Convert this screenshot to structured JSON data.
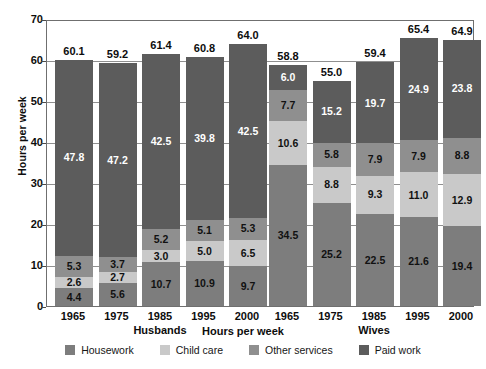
{
  "chart_data": {
    "type": "bar",
    "subtype": "stacked-bar-grouped",
    "title": "",
    "xlabel": "Hours per week",
    "ylabel": "Hours per week",
    "ylim": [
      0,
      70
    ],
    "yticks": [
      0,
      10,
      20,
      30,
      40,
      50,
      60,
      70
    ],
    "grid": true,
    "legend_position": "bottom",
    "categories": [
      "1965",
      "1975",
      "1985",
      "1995",
      "2000",
      "1965",
      "1975",
      "1985",
      "1995",
      "2000"
    ],
    "group_labels": [
      "Husbands",
      "Wives"
    ],
    "series": [
      {
        "name": "Housework",
        "color": "#7d7d7d",
        "values": [
          4.4,
          5.6,
          10.7,
          10.9,
          9.7,
          34.5,
          25.2,
          22.5,
          21.6,
          19.4
        ]
      },
      {
        "name": "Child care",
        "color": "#c9c9c9",
        "values": [
          2.6,
          2.7,
          3.0,
          5.0,
          6.5,
          10.6,
          8.8,
          9.3,
          11.0,
          12.9
        ]
      },
      {
        "name": "Other services",
        "color": "#8f8f8f",
        "values": [
          5.3,
          3.7,
          5.2,
          5.1,
          5.3,
          7.7,
          5.8,
          7.9,
          7.9,
          8.8
        ]
      },
      {
        "name": "Paid work",
        "color": "#5c5c5c",
        "values": [
          47.8,
          47.2,
          42.5,
          39.8,
          42.5,
          6.0,
          15.2,
          19.7,
          24.9,
          23.8
        ]
      }
    ],
    "totals": [
      60.1,
      59.2,
      61.4,
      60.8,
      64.0,
      58.8,
      55.0,
      59.4,
      65.4,
      64.9
    ],
    "groups": [
      {
        "label": "Husbands",
        "bars": [
          {
            "year": "1965",
            "total": "60.1",
            "segments": [
              {
                "series": "Housework",
                "value": "4.4"
              },
              {
                "series": "Child care",
                "value": "2.6"
              },
              {
                "series": "Other services",
                "value": "5.3"
              },
              {
                "series": "Paid work",
                "value": "47.8"
              }
            ]
          },
          {
            "year": "1975",
            "total": "59.2",
            "segments": [
              {
                "series": "Housework",
                "value": "5.6"
              },
              {
                "series": "Child care",
                "value": "2.7"
              },
              {
                "series": "Other services",
                "value": "3.7"
              },
              {
                "series": "Paid work",
                "value": "47.2"
              }
            ]
          },
          {
            "year": "1985",
            "total": "61.4",
            "segments": [
              {
                "series": "Housework",
                "value": "10.7"
              },
              {
                "series": "Child care",
                "value": "3.0"
              },
              {
                "series": "Other services",
                "value": "5.2"
              },
              {
                "series": "Paid work",
                "value": "42.5"
              }
            ]
          },
          {
            "year": "1995",
            "total": "60.8",
            "segments": [
              {
                "series": "Housework",
                "value": "10.9"
              },
              {
                "series": "Child care",
                "value": "5.0"
              },
              {
                "series": "Other services",
                "value": "5.1"
              },
              {
                "series": "Paid work",
                "value": "39.8"
              }
            ]
          },
          {
            "year": "2000",
            "total": "64.0",
            "segments": [
              {
                "series": "Housework",
                "value": "9.7"
              },
              {
                "series": "Child care",
                "value": "6.5"
              },
              {
                "series": "Other services",
                "value": "5.3"
              },
              {
                "series": "Paid work",
                "value": "42.5"
              }
            ]
          }
        ]
      },
      {
        "label": "Wives",
        "bars": [
          {
            "year": "1965",
            "total": "58.8",
            "segments": [
              {
                "series": "Housework",
                "value": "34.5"
              },
              {
                "series": "Child care",
                "value": "10.6"
              },
              {
                "series": "Other services",
                "value": "7.7"
              },
              {
                "series": "Paid work",
                "value": "6.0"
              }
            ]
          },
          {
            "year": "1975",
            "total": "55.0",
            "segments": [
              {
                "series": "Housework",
                "value": "25.2"
              },
              {
                "series": "Child care",
                "value": "8.8"
              },
              {
                "series": "Other services",
                "value": "5.8"
              },
              {
                "series": "Paid work",
                "value": "15.2"
              }
            ]
          },
          {
            "year": "1985",
            "total": "59.4",
            "segments": [
              {
                "series": "Housework",
                "value": "22.5"
              },
              {
                "series": "Child care",
                "value": "9.3"
              },
              {
                "series": "Other services",
                "value": "7.9"
              },
              {
                "series": "Paid work",
                "value": "19.7"
              }
            ]
          },
          {
            "year": "1995",
            "total": "65.4",
            "segments": [
              {
                "series": "Housework",
                "value": "21.6"
              },
              {
                "series": "Child care",
                "value": "11.0"
              },
              {
                "series": "Other services",
                "value": "7.9"
              },
              {
                "series": "Paid work",
                "value": "24.9"
              }
            ]
          },
          {
            "year": "2000",
            "total": "64.9",
            "segments": [
              {
                "series": "Housework",
                "value": "19.4"
              },
              {
                "series": "Child care",
                "value": "12.9"
              },
              {
                "series": "Other services",
                "value": "8.8"
              },
              {
                "series": "Paid work",
                "value": "23.8"
              }
            ]
          }
        ]
      }
    ],
    "legend": [
      {
        "label": "Housework",
        "color": "#7d7d7d"
      },
      {
        "label": "Child care",
        "color": "#c9c9c9"
      },
      {
        "label": "Other services",
        "color": "#8f8f8f"
      },
      {
        "label": "Paid work",
        "color": "#5c5c5c"
      }
    ]
  }
}
